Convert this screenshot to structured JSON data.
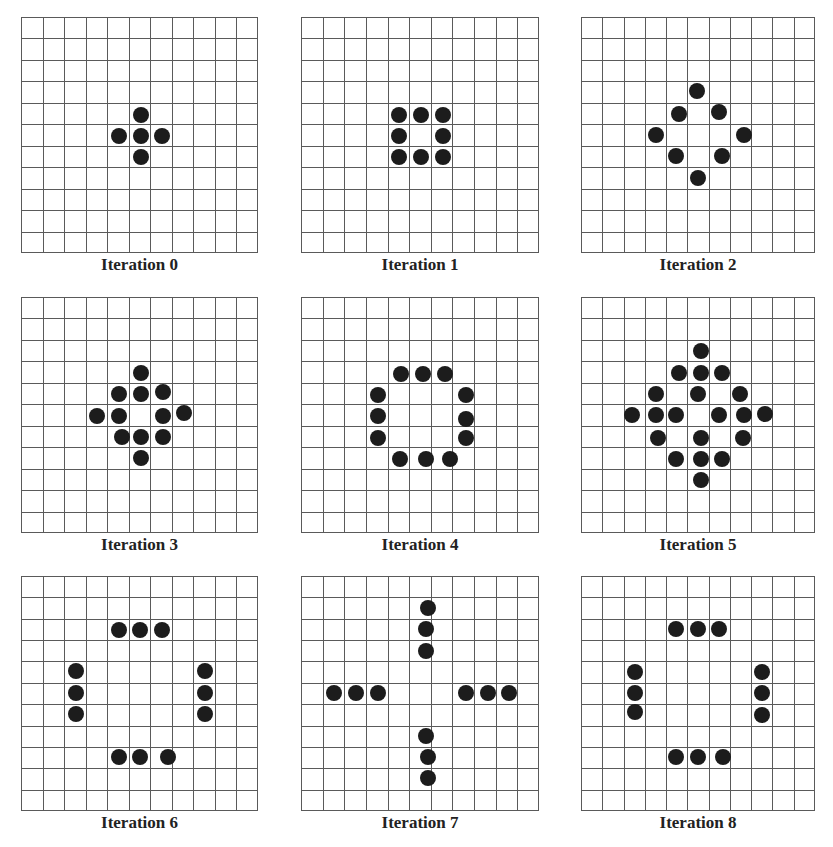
{
  "figure": {
    "grid_size": 11,
    "colors": {
      "grid_line": "#5a5a5a",
      "dot": "#1c1c1c",
      "background": "#ffffff"
    },
    "panels": [
      {
        "label": "Iteration 0",
        "x": 21,
        "y": 17,
        "w": 237,
        "h": 236,
        "dots": [
          [
            5.5,
            4.5
          ],
          [
            4.5,
            5.5
          ],
          [
            5.5,
            5.5
          ],
          [
            6.5,
            5.5
          ],
          [
            5.5,
            6.5
          ]
        ]
      },
      {
        "label": "Iteration 1",
        "x": 301,
        "y": 17,
        "w": 238,
        "h": 236,
        "dots": [
          [
            4.5,
            4.5
          ],
          [
            5.5,
            4.5
          ],
          [
            6.5,
            4.5
          ],
          [
            4.5,
            5.5
          ],
          [
            6.5,
            5.5
          ],
          [
            4.5,
            6.5
          ],
          [
            5.5,
            6.5
          ],
          [
            6.5,
            6.5
          ]
        ]
      },
      {
        "label": "Iteration 2",
        "x": 581,
        "y": 17,
        "w": 234,
        "h": 236,
        "dots": [
          [
            5.4,
            3.4
          ],
          [
            4.58,
            4.48
          ],
          [
            6.44,
            4.36
          ],
          [
            3.47,
            5.46
          ],
          [
            7.63,
            5.46
          ],
          [
            4.4,
            6.45
          ],
          [
            6.57,
            6.45
          ],
          [
            5.43,
            7.47
          ]
        ]
      },
      {
        "label": "Iteration 3",
        "x": 21,
        "y": 297,
        "w": 237,
        "h": 236,
        "dots": [
          [
            5.5,
            3.5
          ],
          [
            4.5,
            4.48
          ],
          [
            5.5,
            4.48
          ],
          [
            6.53,
            4.37
          ],
          [
            3.49,
            5.49
          ],
          [
            4.5,
            5.49
          ],
          [
            6.53,
            5.49
          ],
          [
            7.52,
            5.38
          ],
          [
            4.64,
            6.5
          ],
          [
            5.5,
            6.5
          ],
          [
            6.53,
            6.5
          ],
          [
            5.5,
            7.47
          ]
        ]
      },
      {
        "label": "Iteration 4",
        "x": 301,
        "y": 297,
        "w": 238,
        "h": 236,
        "dots": [
          [
            4.57,
            3.52
          ],
          [
            5.61,
            3.52
          ],
          [
            6.62,
            3.52
          ],
          [
            3.52,
            4.5
          ],
          [
            3.52,
            5.5
          ],
          [
            3.52,
            6.51
          ],
          [
            7.6,
            4.5
          ],
          [
            7.6,
            5.63
          ],
          [
            7.6,
            6.51
          ],
          [
            4.54,
            7.49
          ],
          [
            5.74,
            7.49
          ],
          [
            6.85,
            7.49
          ]
        ]
      },
      {
        "label": "Iteration 5",
        "x": 581,
        "y": 297,
        "w": 234,
        "h": 236,
        "dots": [
          [
            5.58,
            2.48
          ],
          [
            4.57,
            3.49
          ],
          [
            5.58,
            3.49
          ],
          [
            6.56,
            3.49
          ],
          [
            3.46,
            4.47
          ],
          [
            5.43,
            4.47
          ],
          [
            7.44,
            4.47
          ],
          [
            2.37,
            5.47
          ],
          [
            3.46,
            5.47
          ],
          [
            4.42,
            5.47
          ],
          [
            6.43,
            5.47
          ],
          [
            7.6,
            5.47
          ],
          [
            8.6,
            5.41
          ],
          [
            3.58,
            6.51
          ],
          [
            5.58,
            6.51
          ],
          [
            7.57,
            6.51
          ],
          [
            4.42,
            7.49
          ],
          [
            5.58,
            7.49
          ],
          [
            6.56,
            7.49
          ],
          [
            5.58,
            8.48
          ]
        ]
      },
      {
        "label": "Iteration 6",
        "x": 21,
        "y": 576,
        "w": 237,
        "h": 235,
        "dots": [
          [
            4.48,
            2.48
          ],
          [
            5.49,
            2.48
          ],
          [
            6.51,
            2.48
          ],
          [
            2.5,
            4.42
          ],
          [
            2.5,
            5.43
          ],
          [
            2.5,
            6.4
          ],
          [
            8.5,
            4.42
          ],
          [
            8.5,
            5.43
          ],
          [
            8.5,
            6.43
          ],
          [
            4.48,
            8.42
          ],
          [
            5.49,
            8.42
          ],
          [
            6.76,
            8.42
          ]
        ]
      },
      {
        "label": "Iteration 7",
        "x": 301,
        "y": 576,
        "w": 238,
        "h": 235,
        "dots": [
          [
            5.83,
            1.46
          ],
          [
            5.75,
            2.45
          ],
          [
            5.72,
            3.47
          ],
          [
            1.49,
            5.44
          ],
          [
            2.5,
            5.44
          ],
          [
            3.5,
            5.44
          ],
          [
            7.58,
            5.44
          ],
          [
            8.59,
            5.44
          ],
          [
            9.58,
            5.44
          ],
          [
            5.72,
            7.46
          ],
          [
            5.83,
            8.42
          ],
          [
            5.83,
            9.43
          ]
        ]
      },
      {
        "label": "Iteration 8",
        "x": 581,
        "y": 576,
        "w": 234,
        "h": 235,
        "dots": [
          [
            4.43,
            2.45
          ],
          [
            5.44,
            2.45
          ],
          [
            6.42,
            2.45
          ],
          [
            2.47,
            4.43
          ],
          [
            2.47,
            5.44
          ],
          [
            2.47,
            6.34
          ],
          [
            8.47,
            4.43
          ],
          [
            8.47,
            5.44
          ],
          [
            8.47,
            6.45
          ],
          [
            4.43,
            8.43
          ],
          [
            5.44,
            8.43
          ],
          [
            6.65,
            8.43
          ]
        ]
      }
    ]
  }
}
